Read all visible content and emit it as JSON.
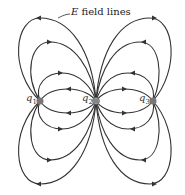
{
  "diagram": {
    "label": {
      "symbol": "E",
      "text": " field lines"
    },
    "charges": [
      {
        "name": "q",
        "sub": "1",
        "x": 40,
        "y": 101,
        "sign": "negative"
      },
      {
        "name": "q",
        "sub": "2",
        "x": 96,
        "y": 101,
        "sign": "positive"
      },
      {
        "name": "q",
        "sub": "3",
        "x": 153,
        "y": 101,
        "sign": "negative"
      }
    ],
    "colors": {
      "line": "#333333",
      "charge": "#777777"
    }
  }
}
